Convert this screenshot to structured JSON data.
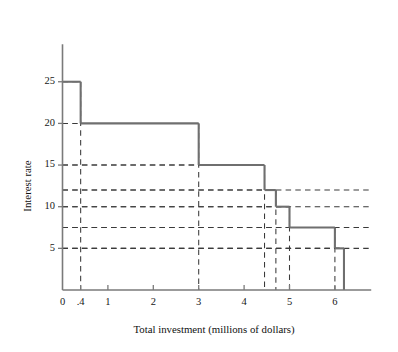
{
  "chart_data": {
    "type": "line",
    "subtype": "step-function",
    "title": "",
    "xlabel": "Total investment (millions of dollars)",
    "ylabel": "Interest rate",
    "xlim": [
      0,
      6.8
    ],
    "ylim": [
      0,
      29.5
    ],
    "grid": "dashed guide lines from each step corner to both axes",
    "legend": "none",
    "x_ticks": [
      {
        "value": 0,
        "label": "0"
      },
      {
        "value": 0.4,
        "label": ".4"
      },
      {
        "value": 1,
        "label": "1"
      },
      {
        "value": 2,
        "label": "2"
      },
      {
        "value": 3,
        "label": "3"
      },
      {
        "value": 4,
        "label": "4"
      },
      {
        "value": 5,
        "label": "5"
      },
      {
        "value": 6,
        "label": "6"
      }
    ],
    "y_ticks": [
      {
        "value": 5,
        "label": "5"
      },
      {
        "value": 10,
        "label": "10"
      },
      {
        "value": 15,
        "label": "15"
      },
      {
        "value": 20,
        "label": "20"
      },
      {
        "value": 25,
        "label": "25"
      }
    ],
    "y_unlabeled_gridlines": [
      7.5,
      12
    ],
    "steps": [
      {
        "x_start": 0,
        "x_end": 0.4,
        "rate": 25
      },
      {
        "x_start": 0.4,
        "x_end": 3,
        "rate": 20
      },
      {
        "x_start": 3,
        "x_end": 4.45,
        "rate": 15
      },
      {
        "x_start": 4.45,
        "x_end": 4.7,
        "rate": 12
      },
      {
        "x_start": 4.7,
        "x_end": 5,
        "rate": 10
      },
      {
        "x_start": 5,
        "x_end": 6,
        "rate": 7.5
      },
      {
        "x_start": 6,
        "x_end": 6.2,
        "rate": 5
      }
    ],
    "drop_x_positions": [
      0.4,
      3,
      4.45,
      4.7,
      5,
      6,
      6.2
    ],
    "colors": {
      "step_line": "#6f6f6f",
      "guide_line": "#3a3a3a",
      "axis": "#7a7a7a",
      "text": "#171717",
      "background": "#ffffff"
    }
  },
  "axes": {
    "x_title": "Total investment (millions of dollars)",
    "y_title": "Interest rate"
  }
}
